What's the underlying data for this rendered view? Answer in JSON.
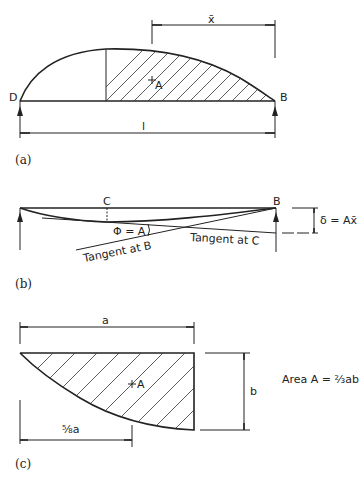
{
  "figure_a": {
    "caption": "(a)",
    "label_left_support": "D",
    "label_right_support": "B",
    "label_centroid": "A",
    "label_span": "l",
    "label_xbar": "x̄"
  },
  "figure_b": {
    "caption": "(b)",
    "label_point_c": "C",
    "label_point_b": "B",
    "label_angle": "Φ = A",
    "label_tangent_b": "Tangent at B",
    "label_tangent_c": "Tangent at C",
    "label_deflection": "δ = Ax̄"
  },
  "figure_c": {
    "caption": "(c)",
    "label_width": "a",
    "label_height": "b",
    "label_centroid": "A",
    "label_centroid_distance": "⅝a",
    "label_area_formula": "Area A = ⅔ab"
  }
}
